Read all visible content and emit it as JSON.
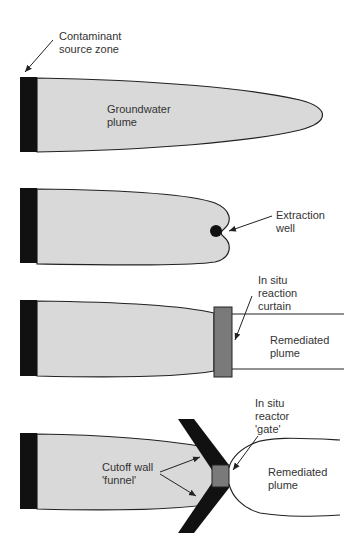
{
  "figure": {
    "colors": {
      "plume": "#d9d9d9",
      "source": "#111111",
      "curtain": "#7a7a7a",
      "outline": "#222222"
    },
    "panels": [
      {
        "id": "natural",
        "labels": {
          "source": "Contaminant\nsource zone",
          "plume": "Groundwater\nplume"
        }
      },
      {
        "id": "pump-and-treat",
        "labels": {
          "well": "Extraction\nwell"
        }
      },
      {
        "id": "reaction-curtain",
        "labels": {
          "curtain": "In situ\nreaction\ncurtain",
          "remediated": "Remediated\nplume"
        }
      },
      {
        "id": "funnel-and-gate",
        "labels": {
          "gate": "In situ\nreactor\n'gate'",
          "funnel": "Cutoff wall\n'funnel'",
          "remediated": "Remediated\nplume"
        }
      }
    ]
  }
}
